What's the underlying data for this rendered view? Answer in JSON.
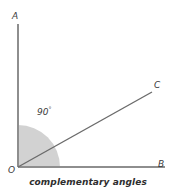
{
  "figure": {
    "caption": "complementary angles",
    "background_color": "#ffffff",
    "line_color": "#8e8e8e",
    "ray_color": "#6b6b6b",
    "sector_fill": "#d2d2d2",
    "text_color": "#3b3b3b"
  },
  "labels": {
    "vertex_origin": "O",
    "ray_vertical_end": "A",
    "ray_horizontal_end": "B",
    "ray_diagonal_end": "C",
    "angle_value": "90",
    "angle_degree_symbol": "°"
  },
  "chart_data": {
    "type": "diagram",
    "title": "complementary angles",
    "subtitle": "",
    "xlabel": "",
    "ylabel": "",
    "grid": false,
    "legend": "none",
    "points": [
      {
        "name": "O",
        "label": "O",
        "x": 18,
        "y": 167,
        "role": "vertex-origin"
      },
      {
        "name": "A",
        "label": "A",
        "x": 18,
        "y": 24,
        "role": "ray-endpoint-vertical"
      },
      {
        "name": "B",
        "label": "B",
        "x": 165,
        "y": 167,
        "role": "ray-endpoint-horizontal"
      },
      {
        "name": "C",
        "label": "C",
        "x": 152,
        "y": 92,
        "role": "ray-endpoint-diagonal"
      }
    ],
    "segments": [
      {
        "name": "OA",
        "from": "O",
        "to": "A",
        "color": "#8e8e8e",
        "width": 2
      },
      {
        "name": "OB",
        "from": "O",
        "to": "B",
        "color": "#8e8e8e",
        "width": 2
      },
      {
        "name": "OC",
        "from": "O",
        "to": "C",
        "color": "#6b6b6b",
        "width": 1.4
      }
    ],
    "angles": [
      {
        "name": "AOB",
        "vertex": "O",
        "between": [
          "OB",
          "OA"
        ],
        "value": 90,
        "unit": "degrees",
        "label": "90°",
        "shaded": true,
        "fill": "#d2d2d2",
        "radius": 42,
        "start_deg": 0,
        "end_deg": 90
      },
      {
        "name": "COB",
        "vertex": "O",
        "between": [
          "OB",
          "OC"
        ],
        "value": 29,
        "unit": "degrees",
        "label": "",
        "shaded": false
      },
      {
        "name": "AOC",
        "vertex": "O",
        "between": [
          "OC",
          "OA"
        ],
        "value": 61,
        "unit": "degrees",
        "label": "",
        "shaded": false
      }
    ],
    "annotations": [
      {
        "text": "90°",
        "x": 40,
        "y": 112
      },
      {
        "text": "complementary angles",
        "x": 88,
        "y": 186
      }
    ]
  }
}
